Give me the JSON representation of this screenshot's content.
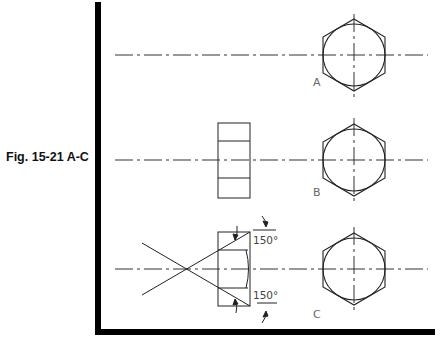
{
  "figure": {
    "caption": "Fig. 15-21 A-C",
    "views": [
      {
        "label": "A",
        "description": "Hexagon with inscribed circle, centerlines"
      },
      {
        "label": "B",
        "description": "Hexagon end view with side rectangle view"
      },
      {
        "label": "C",
        "description": "Hexagon end view with 30° chamfer construction lines"
      }
    ],
    "angle_labels": [
      "150°",
      "150°"
    ],
    "colors": {
      "line": "#222222",
      "centerline": "#333333",
      "frame": "#000000",
      "label": "#666666"
    }
  }
}
